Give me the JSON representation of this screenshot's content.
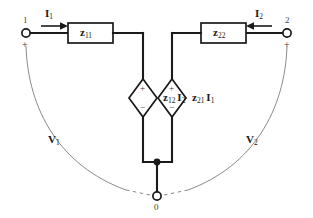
{
  "diagram": {
    "type": "circuit-schematic",
    "colors": {
      "wire": "#1a1a1a",
      "arc": "#8a8a8a",
      "background": "#ffffff"
    }
  },
  "terminals": {
    "input": {
      "number": "1",
      "polarity": "+",
      "node_name": "input-terminal"
    },
    "output": {
      "number": "2",
      "polarity": "+",
      "node_name": "output-terminal"
    },
    "common": {
      "number": "0",
      "node_name": "common-terminal"
    }
  },
  "components": {
    "z11": {
      "symbol": "z",
      "subscript": "11",
      "kind": "impedance-box"
    },
    "z22": {
      "symbol": "z",
      "subscript": "22",
      "kind": "impedance-box"
    },
    "source_left": {
      "symbol": "z",
      "subscript": "12",
      "current_symbol": "I",
      "current_subscript": "2",
      "kind": "dependent-voltage-source",
      "plus": "+",
      "minus": "−"
    },
    "source_right": {
      "symbol": "z",
      "subscript": "21",
      "current_symbol": "I",
      "current_subscript": "1",
      "kind": "dependent-voltage-source",
      "plus": "+",
      "minus": "−"
    }
  },
  "currents": {
    "i1": {
      "symbol": "I",
      "subscript": "1",
      "direction": "right"
    },
    "i2": {
      "symbol": "I",
      "subscript": "2",
      "direction": "left"
    }
  },
  "voltages": {
    "v1": {
      "symbol": "V",
      "subscript": "1"
    },
    "v2": {
      "symbol": "V",
      "subscript": "2"
    }
  }
}
